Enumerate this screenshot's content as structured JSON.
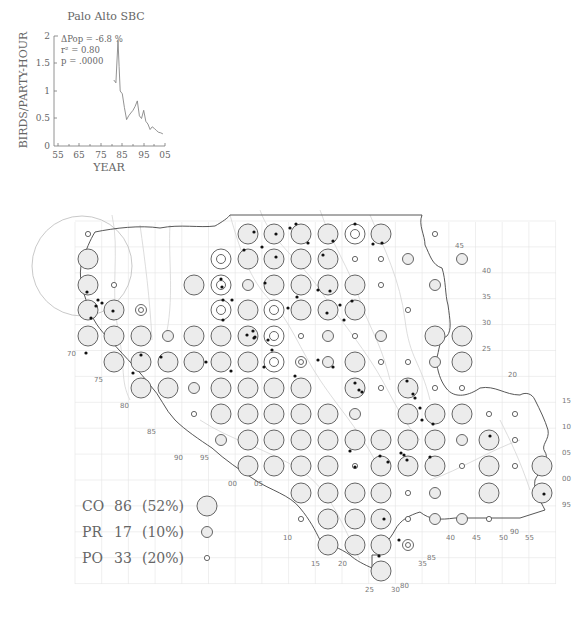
{
  "chart_data": {
    "type": "line",
    "title": "Palo Alto SBC",
    "xlabel": "YEAR",
    "ylabel": "BIRDS/PARTY-HOUR",
    "xticks": [
      "55",
      "65",
      "75",
      "85",
      "95",
      "05"
    ],
    "yticks": [
      "0",
      "0.5",
      "1",
      "1.5",
      "2"
    ],
    "xlim": [
      1955,
      2005
    ],
    "ylim": [
      0,
      2
    ],
    "grid": false,
    "annotations": [
      "ΔPop =  -6.8 %",
      "r² = 0.80",
      "p = .0000"
    ],
    "x": [
      1981,
      1982,
      1983,
      1983.5,
      1984,
      1985,
      1986,
      1987,
      1988,
      1989,
      1990,
      1991,
      1992,
      1993,
      1994,
      1995,
      1996,
      1997,
      1998,
      1999,
      2000,
      2001,
      2002,
      2003,
      2004
    ],
    "values": [
      1.2,
      1.15,
      1.92,
      1.45,
      1.0,
      0.95,
      0.7,
      0.48,
      0.55,
      0.6,
      0.65,
      0.72,
      0.82,
      0.55,
      0.5,
      0.65,
      0.45,
      0.4,
      0.3,
      0.35,
      0.32,
      0.28,
      0.25,
      0.24,
      0.22
    ]
  },
  "legend": [
    {
      "code": "CO",
      "count": "86",
      "pct": "(52%)",
      "size": "large"
    },
    {
      "code": "PR",
      "count": "17",
      "pct": "(10%)",
      "size": "medium"
    },
    {
      "code": "PO",
      "count": "33",
      "pct": "(20%)",
      "size": "small"
    }
  ],
  "map": {
    "row_labels_right": [
      "45",
      "40",
      "35",
      "30",
      "25",
      "20",
      "15",
      "10",
      "05",
      "00",
      "95"
    ],
    "row_labels_left": [
      "70",
      "75",
      "80",
      "85"
    ],
    "col_labels_bottom": [
      "90",
      "95",
      "00",
      "05",
      "10",
      "15",
      "20",
      "25",
      "30",
      "35",
      "40",
      "45",
      "50",
      "55"
    ],
    "extra_labels": [
      "80",
      "85",
      "90"
    ]
  }
}
